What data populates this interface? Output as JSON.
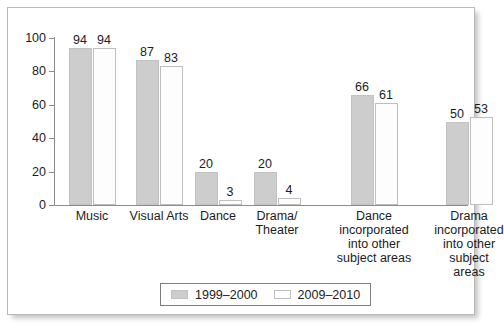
{
  "chart_data": {
    "type": "bar",
    "title": "",
    "xlabel": "",
    "ylabel": "",
    "ylim": [
      0,
      100
    ],
    "yticks": [
      0,
      20,
      40,
      60,
      80,
      100
    ],
    "grid": false,
    "legend_position": "bottom",
    "categories": [
      "Music",
      "Visual Arts",
      "Dance",
      "Drama/\nTheater",
      "Dance\nincorporated\ninto other\nsubject areas",
      "Drama\nincorporated\ninto other\nsubject areas"
    ],
    "series": [
      {
        "name": "1999–2000",
        "color": "#cdcdcd",
        "values": [
          94,
          87,
          20,
          20,
          66,
          50
        ]
      },
      {
        "name": "2009–2010",
        "color": "#ffffff",
        "values": [
          94,
          83,
          3,
          4,
          61,
          53
        ]
      }
    ]
  },
  "legend": {
    "items": [
      {
        "label": "1999–2000"
      },
      {
        "label": "2009–2010"
      }
    ]
  }
}
